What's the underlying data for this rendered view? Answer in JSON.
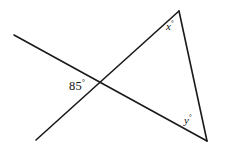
{
  "figure": {
    "type": "geometry-diagram",
    "background_color": "#ffffff",
    "stroke_color": "#1a1a1a",
    "stroke_width": 1.6,
    "width": 230,
    "height": 153,
    "labels": {
      "known_angle": {
        "value": "85",
        "degree_symbol": "°",
        "text": "85°",
        "x": 69,
        "y": 79
      },
      "angle_x": {
        "value": "x",
        "degree_symbol": "°",
        "text": "x°",
        "x": 166,
        "y": 20
      },
      "angle_y": {
        "value": "y",
        "degree_symbol": "°",
        "text": "y°",
        "x": 184,
        "y": 114
      }
    },
    "points": {
      "transversal_start": {
        "x": 14,
        "y": 35
      },
      "transversal_end": {
        "x": 36,
        "y": 140
      },
      "intersection": {
        "x": 97,
        "y": 86
      },
      "apex": {
        "x": 179,
        "y": 11
      },
      "bottom_right": {
        "x": 207,
        "y": 141
      }
    },
    "segments": [
      {
        "name": "transversal-line",
        "x1": 14,
        "y1": 35,
        "x2": 36,
        "y2": 140
      },
      {
        "name": "upper-left-ray-to-apex",
        "x1": 14,
        "y1": 35,
        "x2": 179,
        "y2": 11
      },
      {
        "name": "lower-left-ray-to-bottom-right",
        "x1": 36,
        "y1": 140,
        "x2": 207,
        "y2": 141
      },
      {
        "name": "triangle-right-side",
        "x1": 179,
        "y1": 11,
        "x2": 207,
        "y2": 141
      }
    ]
  }
}
